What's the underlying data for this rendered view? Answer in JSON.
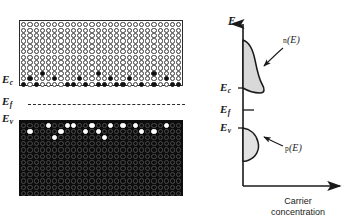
{
  "left_panel": {
    "name": "band-lattice-diagram",
    "conduction_band": {
      "label": "E",
      "subscript": "c",
      "description": "open circles lattice with a few filled electron states near band edge",
      "rows": 12,
      "cols": 26,
      "electrons": [
        [
          9,
          3
        ],
        [
          10,
          1
        ],
        [
          10,
          5
        ],
        [
          11,
          0
        ],
        [
          11,
          2
        ],
        [
          11,
          7
        ],
        [
          10,
          9
        ],
        [
          11,
          8
        ],
        [
          11,
          10
        ],
        [
          9,
          12
        ],
        [
          11,
          12
        ],
        [
          11,
          13
        ],
        [
          10,
          14
        ],
        [
          11,
          15
        ],
        [
          11,
          16
        ],
        [
          10,
          17
        ],
        [
          11,
          19
        ],
        [
          9,
          21
        ],
        [
          11,
          21
        ],
        [
          10,
          23
        ],
        [
          11,
          24
        ],
        [
          11,
          25
        ]
      ]
    },
    "valence_band": {
      "label": "E",
      "subscript": "v",
      "description": "filled circles lattice with a few empty hole states near band edge",
      "rows": 12,
      "cols": 26,
      "holes": [
        [
          0,
          4
        ],
        [
          0,
          7
        ],
        [
          0,
          8
        ],
        [
          0,
          11
        ],
        [
          0,
          14
        ],
        [
          0,
          16
        ],
        [
          0,
          18
        ],
        [
          0,
          23
        ],
        [
          1,
          1
        ],
        [
          1,
          6
        ],
        [
          1,
          10
        ],
        [
          1,
          12
        ],
        [
          1,
          19
        ],
        [
          1,
          21
        ],
        [
          2,
          5
        ],
        [
          2,
          13
        ]
      ]
    },
    "fermi_level": {
      "label": "E",
      "subscript": "f",
      "style": "dashed"
    }
  },
  "right_panel": {
    "name": "carrier-concentration-plot",
    "y_axis_label": "E",
    "x_axis_caption_line1": "Carrier",
    "x_axis_caption_line2": "concentration",
    "levels": [
      {
        "label": "E",
        "subscript": "c",
        "name": "conduction-band-edge"
      },
      {
        "label": "E",
        "subscript": "f",
        "name": "fermi-level"
      },
      {
        "label": "E",
        "subscript": "v",
        "name": "valence-band-edge"
      }
    ],
    "curves": [
      {
        "fn": "n",
        "arg": "(E)",
        "name": "electron-concentration-curve"
      },
      {
        "fn": "p",
        "arg": "(E)",
        "name": "hole-concentration-curve"
      }
    ]
  },
  "colors": {
    "ink": "#1a1a1a",
    "lattice_open": "#ffffff",
    "lattice_filled": "#121212",
    "curve_fill": "#d9d9d9",
    "axis": "#1a1a1a"
  },
  "chart_data": {
    "type": "area",
    "xlabel": "Carrier concentration",
    "ylabel": "E",
    "grid": false,
    "legend": "inline-annotations",
    "axis_orientation": "energy-vertical",
    "levels": {
      "Ec": 88,
      "Ef": 110,
      "Ev": 128
    },
    "series": [
      {
        "name": "n(E)",
        "note": "electron distribution above Ec, peaks just above conduction band edge then decays upward",
        "energy": [
          88,
          84,
          80,
          76,
          72,
          68,
          64,
          60,
          56,
          52,
          48,
          44,
          40
        ],
        "values": [
          0,
          12,
          19,
          22,
          21,
          18,
          15,
          12,
          9,
          6,
          4,
          2,
          0
        ]
      },
      {
        "name": "p(E)",
        "note": "hole distribution below Ev, peaks just below valence band edge then decays downward",
        "energy": [
          128,
          132,
          136,
          140,
          144,
          148,
          152,
          156,
          160
        ],
        "values": [
          0,
          10,
          15,
          17,
          15,
          12,
          8,
          4,
          0
        ]
      }
    ]
  }
}
